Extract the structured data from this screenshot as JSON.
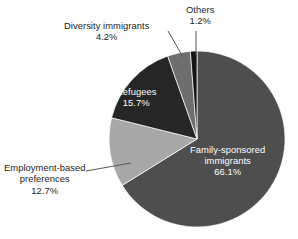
{
  "chart_data": {
    "type": "pie",
    "title": "",
    "subtitle": "",
    "xlabel": "",
    "ylabel": "",
    "grid": false,
    "legend_position": "none",
    "label_format": "name + percent",
    "start_angle_deg": 0,
    "direction": "clockwise",
    "categories": [
      "Family-sponsored immigrants",
      "Employment-based preferences",
      "Refugees",
      "Diversity immigrants",
      "Others"
    ],
    "values": [
      66.1,
      12.7,
      15.7,
      4.2,
      1.2
    ],
    "units": "percent",
    "slices": [
      {
        "name": "Family-sponsored immigrants",
        "label_line1": "Family-sponsored",
        "label_line2": "immigrants",
        "percent": 66.1,
        "percent_text": "66.1%",
        "color": "#4e4e4e",
        "label_placement": "inside",
        "label_color": "#ffffff",
        "leader_line": false
      },
      {
        "name": "Employment-based preferences",
        "label_line1": "Employment-based",
        "label_line2": "preferences",
        "percent": 12.7,
        "percent_text": "12.7%",
        "color": "#a8a8a8",
        "label_placement": "outside-left",
        "label_color": "#1b1b1b",
        "leader_line": true
      },
      {
        "name": "Refugees",
        "label_line1": "Refugees",
        "label_line2": "",
        "percent": 15.7,
        "percent_text": "15.7%",
        "color": "#262626",
        "label_placement": "inside",
        "label_color": "#ffffff",
        "leader_line": false
      },
      {
        "name": "Diversity immigrants",
        "label_line1": "Diversity immigrants",
        "label_line2": "",
        "percent": 4.2,
        "percent_text": "4.2%",
        "color": "#6e6e6e",
        "label_placement": "outside-top-left",
        "label_color": "#1b1b1b",
        "leader_line": true
      },
      {
        "name": "Others",
        "label_line1": "Others",
        "label_line2": "",
        "percent": 1.2,
        "percent_text": "1.2%",
        "color": "#141414",
        "label_placement": "outside-top",
        "label_color": "#1b1b1b",
        "leader_line": true
      }
    ],
    "geometry": {
      "center_x": 197,
      "center_y": 139,
      "radius": 88
    }
  },
  "labels": {
    "diversity": {
      "name": "Diversity immigrants",
      "percent": "4.2%"
    },
    "others": {
      "name": "Others",
      "percent": "1.2%"
    },
    "employment": {
      "line1": "Employment-based",
      "line2": "preferences",
      "percent": "12.7%"
    },
    "refugees": {
      "name": "Refugees",
      "percent": "15.7%"
    },
    "family": {
      "line1": "Family-sponsored",
      "line2": "immigrants",
      "percent": "66.1%"
    }
  },
  "colors": {
    "background": "#ffffff",
    "family_sponsored": "#4e4e4e",
    "employment_based": "#a8a8a8",
    "refugees": "#262626",
    "diversity": "#6e6e6e",
    "others": "#141414",
    "text_dark": "#1b1b1b",
    "text_light": "#ffffff",
    "leader_line": "#555555"
  }
}
